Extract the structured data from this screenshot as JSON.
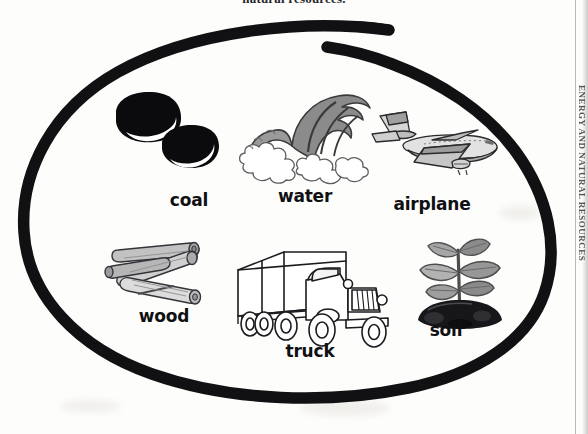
{
  "page": {
    "background_color": "#fdfdfb",
    "ink_color": "#101013",
    "header_text": "natural resources.",
    "edge_vertical_text": "ENERGY AND NATURAL RESOURCES"
  },
  "grouping_oval": {
    "label": "hand-drawn oval enclosing all items",
    "stroke_color": "#111114",
    "stroke_width_px": 11
  },
  "items": [
    {
      "id": "coal",
      "label": "coal",
      "icon": "coal-lumps-icon",
      "description": "two glossy black lumps of coal with white highlight arcs",
      "row": 1,
      "column": 1,
      "colors": {
        "fill": "#0c0c0e",
        "highlight": "#ffffff"
      }
    },
    {
      "id": "water",
      "label": "water",
      "icon": "ocean-wave-icon",
      "description": "grey breaking ocean wave with white foam",
      "row": 1,
      "column": 2,
      "colors": {
        "fill": "#8d8d8d",
        "dark": "#4a4a4a",
        "foam": "#ffffff"
      }
    },
    {
      "id": "airplane",
      "label": "airplane",
      "icon": "jet-airliner-icon",
      "description": "grey three-engine jet airliner in flight",
      "row": 1,
      "column": 3,
      "colors": {
        "fill": "#c9c9c9",
        "shade": "#8e8e8e",
        "outline": "#2a2a2c"
      }
    },
    {
      "id": "wood",
      "label": "wood",
      "icon": "wood-logs-icon",
      "description": "stacked pile of cut grey logs",
      "row": 2,
      "column": 1,
      "colors": {
        "fill": "#b9b9b9",
        "shade": "#8a8a8a",
        "outline": "#34343a"
      }
    },
    {
      "id": "truck",
      "label": "truck",
      "icon": "box-truck-icon",
      "description": "black line-art box delivery truck, no fill",
      "row": 2,
      "column": 2,
      "colors": {
        "fill": "#ffffff",
        "outline": "#1c1c20"
      }
    },
    {
      "id": "soil",
      "label": "soil",
      "icon": "seedling-in-soil-icon",
      "description": "young grey-green seedling growing from a dark mound of soil",
      "row": 2,
      "column": 3,
      "colors": {
        "leaf": "#9e9e9e",
        "leaf_dark": "#6f6f6f",
        "soil": "#19191c"
      }
    }
  ]
}
